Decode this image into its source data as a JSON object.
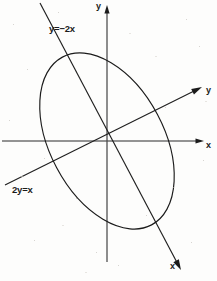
{
  "figure": {
    "width": 217,
    "height": 281,
    "background_color": "#fdfdfc",
    "ink_color": "#1b1b1b"
  },
  "axes": {
    "origin": {
      "x": 107,
      "y": 141
    },
    "x_axis": {
      "label": "x",
      "from": {
        "x": 2,
        "y": 141
      },
      "to": {
        "x": 204,
        "y": 141
      },
      "arrow": "right"
    },
    "y_axis": {
      "label": "y",
      "from": {
        "x": 107,
        "y": 262
      },
      "to": {
        "x": 107,
        "y": 5
      },
      "arrow": "up"
    },
    "y_prime_axis": {
      "label": "y",
      "equation": "2y=x",
      "from": {
        "x": 5,
        "y": 185
      },
      "to": {
        "x": 202,
        "y": 87
      },
      "arrow": "upper-right",
      "slope": 0.5
    },
    "x_prime_axis": {
      "label": "x",
      "equation": "y=−2x",
      "from": {
        "x": 40,
        "y": 3
      },
      "to": {
        "x": 181,
        "y": 270
      },
      "arrow": "lower-right",
      "slope": -2
    }
  },
  "labels": {
    "y_axis_label": "y",
    "x_axis_label": "x",
    "y_prime_label": "y",
    "x_prime_label": "x",
    "equation_x_prime": "y=−2x",
    "equation_y_prime": "2y=x"
  },
  "chart_data": {
    "type": "scatter",
    "xlabel": "x",
    "ylabel": "y",
    "grid": false,
    "legend": null,
    "annotations": [
      {
        "text": "y=−2x",
        "x": 49,
        "y": 24,
        "describes": "rotated x-prime axis"
      },
      {
        "text": "2y=x",
        "x": 12,
        "y": 185,
        "describes": "rotated y-prime axis"
      },
      {
        "text": "y",
        "x": 96,
        "y": 2,
        "describes": "original y axis arrow tip"
      },
      {
        "text": "x",
        "x": 206,
        "y": 141,
        "describes": "original x axis arrow tip"
      },
      {
        "text": "y",
        "x": 206,
        "y": 86,
        "describes": "rotated y-prime axis arrow tip"
      },
      {
        "text": "x",
        "x": 170,
        "y": 262,
        "describes": "rotated x-prime axis arrow tip"
      }
    ],
    "series": [
      {
        "name": "ellipse",
        "type": "conic",
        "shape": "ellipse",
        "center": {
          "x": 107,
          "y": 141
        },
        "semi_major": 95,
        "semi_minor": 57,
        "rotation_deg": -28,
        "stroke": "#1b1b1b",
        "fill": "none"
      },
      {
        "name": "line y=-2x",
        "type": "line",
        "slope": -2,
        "intercept": 0,
        "stroke": "#1b1b1b"
      },
      {
        "name": "line 2y=x",
        "type": "line",
        "slope": 0.5,
        "intercept": 0,
        "stroke": "#1b1b1b"
      }
    ]
  }
}
